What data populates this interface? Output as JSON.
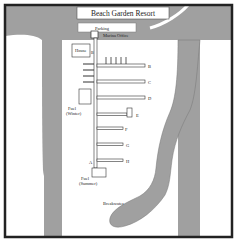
{
  "map": {
    "title": "Beach Garden Resort",
    "colors": {
      "water": "#a0a0a0",
      "land": "#ffffff",
      "border": "#222222",
      "dock": "#ffffff",
      "dock_stroke": "#333333"
    },
    "labels": {
      "parking": "Parking",
      "marina_office": "Marina Office",
      "house": "House",
      "fuel_winter_1": "Fuel",
      "fuel_winter_2": "(Winter)",
      "fuel_summer_1": "Fuel",
      "fuel_summer_2": "(Summer)",
      "breakwater": "Breakwater"
    },
    "docks": [
      {
        "id": "A",
        "label": "A"
      },
      {
        "id": "B",
        "label": "B"
      },
      {
        "id": "C",
        "label": "C"
      },
      {
        "id": "D",
        "label": "D"
      },
      {
        "id": "E",
        "label": "E"
      },
      {
        "id": "F",
        "label": "F"
      },
      {
        "id": "G",
        "label": "G"
      },
      {
        "id": "H",
        "label": "H"
      }
    ]
  }
}
